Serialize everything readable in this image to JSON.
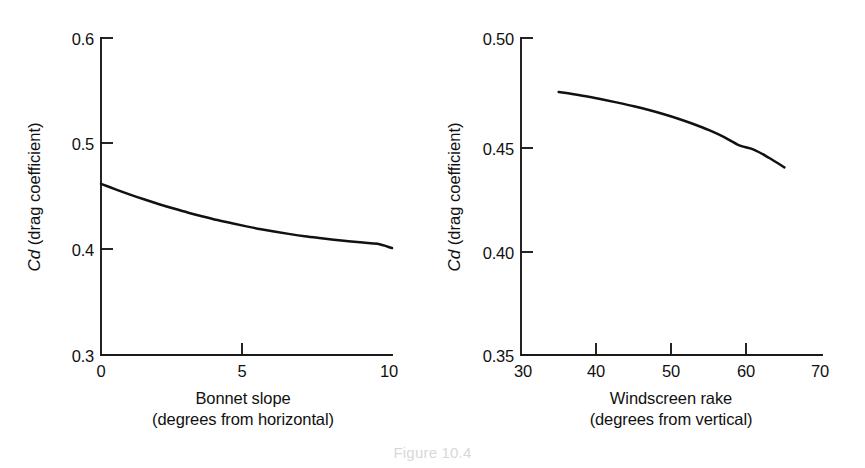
{
  "figure": {
    "caption": "Figure 10.4",
    "background_color": "#ffffff",
    "ink_color": "#111111"
  },
  "chart_data": [
    {
      "id": "bonnet-slope",
      "type": "line",
      "title": "",
      "xlabel": "Bonnet slope",
      "xlabel_sub": "(degrees from horizontal)",
      "ylabel_var": "Cd",
      "ylabel_rest": " (drag coefficient)",
      "ylabel_full": "Cd (drag coefficient)",
      "xlim": [
        0,
        10
      ],
      "ylim": [
        0.3,
        0.6
      ],
      "xticks": [
        0,
        5,
        10
      ],
      "xticklabels": [
        "0",
        "5",
        "10"
      ],
      "yticks": [
        0.3,
        0.4,
        0.5,
        0.6
      ],
      "yticklabels": [
        "0.3",
        "0.4",
        "0.5",
        "0.6"
      ],
      "grid": false,
      "legend": "none",
      "x": [
        0,
        0.5,
        1,
        1.5,
        2,
        2.5,
        3,
        3.5,
        4,
        4.5,
        5,
        5.5,
        6,
        6.5,
        7,
        7.5,
        8,
        8.5,
        9,
        9.5,
        10
      ],
      "y": [
        0.462,
        0.4568,
        0.4518,
        0.4471,
        0.4427,
        0.4386,
        0.4347,
        0.4311,
        0.4277,
        0.4246,
        0.4217,
        0.419,
        0.4166,
        0.4144,
        0.4124,
        0.4107,
        0.4091,
        0.4077,
        0.4064,
        0.4052,
        0.4012
      ]
    },
    {
      "id": "windscreen-rake",
      "type": "line",
      "title": "",
      "xlabel": "Windscreen rake",
      "xlabel_sub": "(degrees from vertical)",
      "ylabel_var": "Cd",
      "ylabel_rest": " (drag coefficient)",
      "ylabel_full": "Cd (drag coefficient)",
      "xlim": [
        30,
        70
      ],
      "ylim": [
        0.35,
        0.5
      ],
      "xticks": [
        30,
        40,
        50,
        60,
        70
      ],
      "xticklabels": [
        "30",
        "40",
        "50",
        "60",
        "70"
      ],
      "yticks": [
        0.35,
        0.4,
        0.45,
        0.5
      ],
      "yticklabels": [
        "0.35",
        "0.40",
        "0.45",
        "0.50"
      ],
      "grid": false,
      "legend": "none",
      "x": [
        35,
        37,
        39,
        41,
        43,
        45,
        47,
        49,
        51,
        53,
        55,
        57,
        59,
        61,
        63,
        65
      ],
      "y": [
        0.4745,
        0.4734,
        0.4722,
        0.4708,
        0.4693,
        0.4677,
        0.4659,
        0.4639,
        0.4617,
        0.4592,
        0.4564,
        0.4531,
        0.4492,
        0.4471,
        0.4432,
        0.4388
      ]
    }
  ]
}
